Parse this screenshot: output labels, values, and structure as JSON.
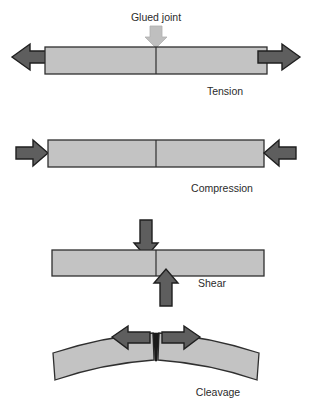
{
  "figure": {
    "background_color": "#ffffff",
    "annotation": {
      "label": "Glued joint",
      "pointer_icon": "down-arrow-icon",
      "pointer_color": "#bfbfbf",
      "pointer_outline": "#a6a6a6"
    },
    "palette": {
      "bar_fill": "#c3c3c3",
      "bar_stroke": "#2f2f2f",
      "arrow_fill": "#5e5e5e",
      "arrow_stroke": "#1f1f1f",
      "joint_line": "#2f2f2f",
      "caption_color": "#2b2b2b",
      "crack_fill": "#1a1a1a"
    },
    "panels": [
      {
        "id": "tension",
        "caption": "Tension",
        "stress_type": "tension",
        "description": "Two arrows pull outward in opposite directions along the bar axis",
        "arrows": [
          {
            "name": "left-tension-arrow",
            "direction": "left"
          },
          {
            "name": "right-tension-arrow",
            "direction": "right"
          }
        ],
        "has_glued_joint_label": true,
        "joint_position": "center"
      },
      {
        "id": "compression",
        "caption": "Compression",
        "stress_type": "compression",
        "description": "Two arrows push inward toward each other along the bar axis",
        "arrows": [
          {
            "name": "left-compression-arrow",
            "direction": "right"
          },
          {
            "name": "right-compression-arrow",
            "direction": "left"
          }
        ],
        "has_glued_joint_label": false,
        "joint_position": "center"
      },
      {
        "id": "shear",
        "caption": "Shear",
        "stress_type": "shear",
        "description": "One arrow presses down left of the joint while another presses up right of the joint",
        "arrows": [
          {
            "name": "down-shear-arrow",
            "direction": "down"
          },
          {
            "name": "up-shear-arrow",
            "direction": "up"
          }
        ],
        "has_glued_joint_label": false,
        "joint_position": "center"
      },
      {
        "id": "cleavage",
        "caption": "Cleavage",
        "stress_type": "cleavage",
        "description": "A bent beam splits open at the joint; arrows pull apart sideways at the crack",
        "arrows": [
          {
            "name": "left-cleavage-arrow",
            "direction": "left"
          },
          {
            "name": "right-cleavage-arrow",
            "direction": "right"
          }
        ],
        "has_glued_joint_label": false,
        "joint_position": "center-crack"
      }
    ]
  }
}
